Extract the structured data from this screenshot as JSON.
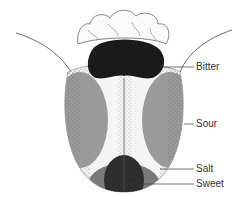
{
  "diagram": {
    "labels": [
      {
        "id": "bitter",
        "text": "Bitter",
        "x": 196,
        "y": 62
      },
      {
        "id": "sour",
        "text": "Sour",
        "x": 196,
        "y": 119
      },
      {
        "id": "salt",
        "text": "Salt",
        "x": 196,
        "y": 164
      },
      {
        "id": "sweet",
        "text": "Sweet",
        "x": 196,
        "y": 179
      }
    ],
    "colors": {
      "bitter": "#1a1a1a",
      "sour": "#9a9a9a",
      "salt": "#7a7a7a",
      "sweet": "#2a2a2a",
      "stipple": "#555555",
      "outline": "#444444"
    }
  }
}
